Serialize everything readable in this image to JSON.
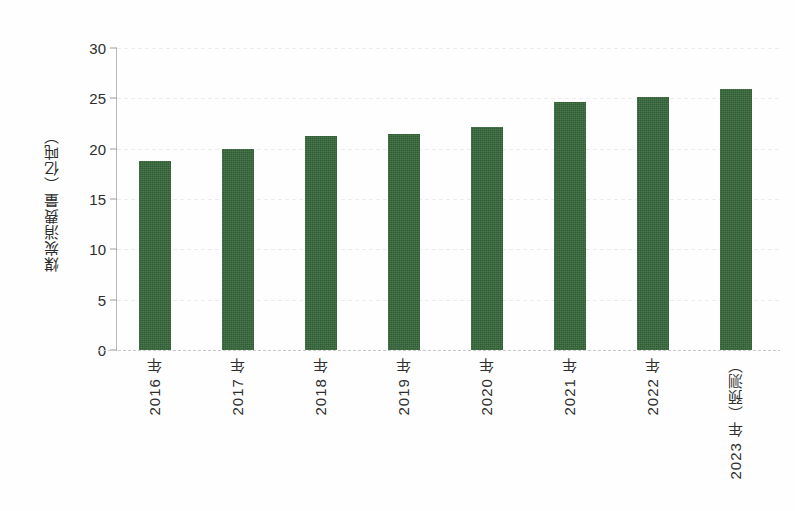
{
  "chart_data": {
    "type": "bar",
    "title": "",
    "xlabel": "",
    "ylabel": "煤炭消费量（亿吨）",
    "categories": [
      "2016 年",
      "2017 年",
      "2018 年",
      "2019 年",
      "2020 年",
      "2021 年",
      "2022 年",
      "2023 年（预测）"
    ],
    "values": [
      18.8,
      20.0,
      21.3,
      21.5,
      22.2,
      24.6,
      25.1,
      25.9
    ],
    "ylim": [
      0,
      30
    ],
    "ytick_labels": [
      "0",
      "5",
      "10",
      "15",
      "20",
      "25",
      "30"
    ],
    "ytick_values": [
      0,
      5,
      10,
      15,
      20,
      25,
      30
    ],
    "grid": "horizontal-dotted",
    "legend": "none",
    "series": [
      {
        "name": "煤炭消费量（亿吨）",
        "color": "#35663A",
        "values": [
          18.8,
          20.0,
          21.3,
          21.5,
          22.2,
          24.6,
          25.1,
          25.9
        ]
      }
    ],
    "bar_color": "#35663A",
    "background_color": "#FEFEFE",
    "axis_color": "#B9B9B9"
  }
}
